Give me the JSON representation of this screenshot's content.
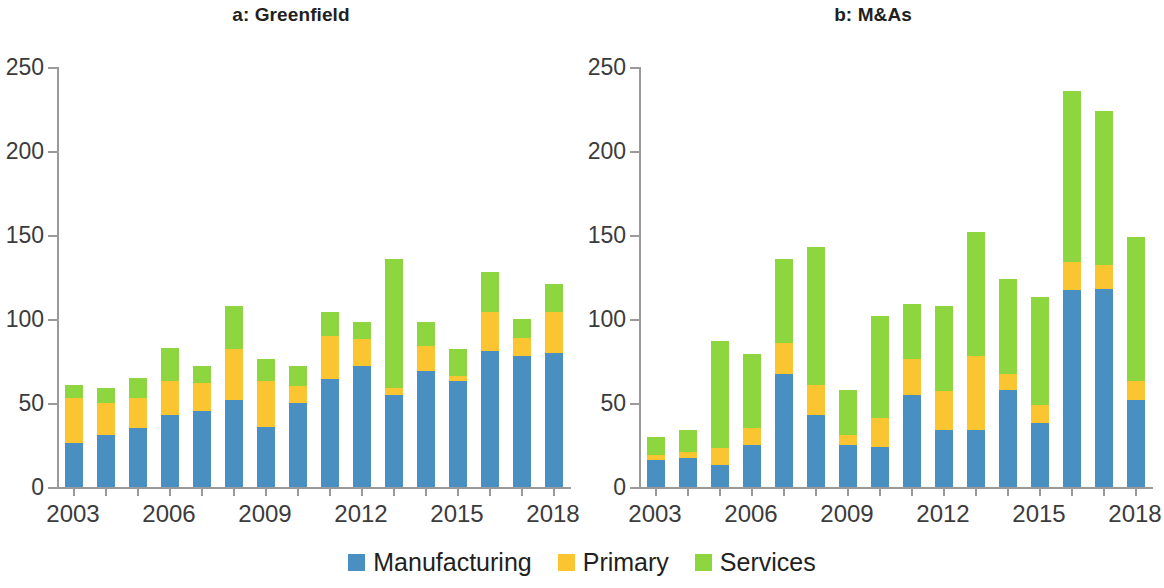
{
  "figure": {
    "background": "#ffffff"
  },
  "legend": {
    "position": "bottom-center",
    "items": [
      {
        "label": "Manufacturing",
        "color": "#4a8fc2",
        "swatch_name": "legend-swatch-manufacturing"
      },
      {
        "label": "Primary",
        "color": "#fbc531",
        "swatch_name": "legend-swatch-primary"
      },
      {
        "label": "Services",
        "color": "#8ed63f",
        "swatch_name": "legend-swatch-services"
      }
    ]
  },
  "chart_data": [
    {
      "type": "bar",
      "stacked": true,
      "panel": "a",
      "title": "a: Greenfield",
      "xlabel": "",
      "ylabel": "",
      "ylim": [
        0,
        250
      ],
      "yticks": [
        0,
        50,
        100,
        150,
        200,
        250
      ],
      "grid": false,
      "legend_position": "figure-bottom-center",
      "categories": [
        "2003",
        "2004",
        "2005",
        "2006",
        "2007",
        "2008",
        "2009",
        "2010",
        "2011",
        "2012",
        "2013",
        "2014",
        "2015",
        "2016",
        "2017",
        "2018"
      ],
      "xtick_labels": [
        "2003",
        "2006",
        "2009",
        "2012",
        "2015",
        "2018"
      ],
      "series": [
        {
          "name": "Manufacturing",
          "color": "#4a8fc2",
          "values": [
            26,
            31,
            35,
            43,
            45,
            52,
            36,
            50,
            64,
            72,
            55,
            69,
            63,
            81,
            78,
            80
          ]
        },
        {
          "name": "Primary",
          "color": "#fbc531",
          "values": [
            27,
            19,
            18,
            20,
            17,
            30,
            27,
            10,
            26,
            16,
            4,
            15,
            3,
            23,
            11,
            24
          ]
        },
        {
          "name": "Services",
          "color": "#8ed63f",
          "values": [
            8,
            9,
            12,
            20,
            10,
            26,
            13,
            12,
            14,
            10,
            77,
            14,
            16,
            24,
            11,
            17
          ]
        }
      ],
      "totals": [
        61,
        59,
        65,
        83,
        72,
        108,
        76,
        72,
        104,
        98,
        136,
        98,
        82,
        128,
        100,
        121
      ]
    },
    {
      "type": "bar",
      "stacked": true,
      "panel": "b",
      "title": "b: M&As",
      "xlabel": "",
      "ylabel": "",
      "ylim": [
        0,
        250
      ],
      "yticks": [
        0,
        50,
        100,
        150,
        200,
        250
      ],
      "grid": false,
      "legend_position": "figure-bottom-center",
      "categories": [
        "2003",
        "2004",
        "2005",
        "2006",
        "2007",
        "2008",
        "2009",
        "2010",
        "2011",
        "2012",
        "2013",
        "2014",
        "2015",
        "2016",
        "2017",
        "2018"
      ],
      "xtick_labels": [
        "2003",
        "2006",
        "2009",
        "2012",
        "2015",
        "2018"
      ],
      "series": [
        {
          "name": "Manufacturing",
          "color": "#4a8fc2",
          "values": [
            16,
            17,
            13,
            25,
            67,
            43,
            25,
            24,
            55,
            34,
            34,
            58,
            38,
            117,
            118,
            52
          ]
        },
        {
          "name": "Primary",
          "color": "#fbc531",
          "values": [
            3,
            4,
            10,
            10,
            19,
            18,
            6,
            17,
            21,
            23,
            44,
            9,
            11,
            17,
            14,
            11
          ]
        },
        {
          "name": "Services",
          "color": "#8ed63f",
          "values": [
            11,
            13,
            64,
            44,
            50,
            82,
            27,
            61,
            33,
            51,
            74,
            57,
            64,
            102,
            92,
            86
          ]
        }
      ],
      "totals": [
        30,
        34,
        87,
        79,
        136,
        143,
        58,
        102,
        109,
        108,
        152,
        124,
        113,
        236,
        224,
        149
      ]
    }
  ]
}
